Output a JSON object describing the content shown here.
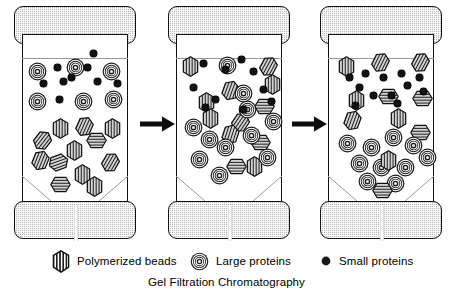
{
  "figure": {
    "caption": "Gel Filtration Chromatography"
  },
  "legend": {
    "items": [
      {
        "icon": "hexagon-hatched-bead-icon",
        "label": "Polymerized beads"
      },
      {
        "icon": "concentric-circle-icon",
        "label": "Large proteins"
      },
      {
        "icon": "solid-dot-icon",
        "label": "Small proteins"
      }
    ]
  },
  "colors": {
    "outline": "#111111",
    "cap_fill": "#b9b9b9",
    "particle_dark": "#1a1a1a",
    "background": "#ffffff"
  },
  "columns": [
    {
      "name": "column-stage-1",
      "stage": "loading",
      "counts": {
        "beads": 12,
        "large_proteins": 6,
        "small_proteins": 9
      },
      "particles": [
        {
          "type": "large",
          "x": 6,
          "y": 28,
          "rot": 0
        },
        {
          "type": "large",
          "x": 44,
          "y": 24,
          "rot": 0
        },
        {
          "type": "large",
          "x": 80,
          "y": 28,
          "rot": 0
        },
        {
          "type": "large",
          "x": 6,
          "y": 58,
          "rot": 0
        },
        {
          "type": "large",
          "x": 52,
          "y": 58,
          "rot": 0
        },
        {
          "type": "large",
          "x": 82,
          "y": 56,
          "rot": 0
        },
        {
          "type": "small",
          "x": 32,
          "y": 30,
          "rot": 0
        },
        {
          "type": "small",
          "x": 62,
          "y": 30,
          "rot": 0
        },
        {
          "type": "small",
          "x": 18,
          "y": 46,
          "rot": 0
        },
        {
          "type": "small",
          "x": 38,
          "y": 44,
          "rot": 0
        },
        {
          "type": "small",
          "x": 46,
          "y": 40,
          "rot": 0
        },
        {
          "type": "small",
          "x": 72,
          "y": 44,
          "rot": 0
        },
        {
          "type": "small",
          "x": 92,
          "y": 46,
          "rot": 0
        },
        {
          "type": "small",
          "x": 34,
          "y": 62,
          "rot": 0
        },
        {
          "type": "small",
          "x": 68,
          "y": 16,
          "rot": 0
        },
        {
          "type": "bead",
          "x": 30,
          "y": 84,
          "rot": 0
        },
        {
          "type": "bead",
          "x": 54,
          "y": 82,
          "rot": 24
        },
        {
          "type": "bead",
          "x": 82,
          "y": 84,
          "rot": 0
        },
        {
          "type": "bead",
          "x": 12,
          "y": 96,
          "rot": 38
        },
        {
          "type": "bead",
          "x": 66,
          "y": 96,
          "rot": 90
        },
        {
          "type": "bead",
          "x": 44,
          "y": 106,
          "rot": 0
        },
        {
          "type": "bead",
          "x": 10,
          "y": 116,
          "rot": 22
        },
        {
          "type": "bead",
          "x": 28,
          "y": 118,
          "rot": 70
        },
        {
          "type": "bead",
          "x": 80,
          "y": 118,
          "rot": 30
        },
        {
          "type": "bead",
          "x": 52,
          "y": 130,
          "rot": 0
        },
        {
          "type": "bead",
          "x": 30,
          "y": 140,
          "rot": 90
        },
        {
          "type": "bead",
          "x": 64,
          "y": 142,
          "rot": 0
        }
      ]
    },
    {
      "name": "column-stage-2",
      "stage": "separating",
      "counts": {
        "beads": 12,
        "large_proteins": 11,
        "small_proteins": 10
      },
      "particles": [
        {
          "type": "bead",
          "x": 6,
          "y": 22,
          "rot": 0
        },
        {
          "type": "bead",
          "x": 84,
          "y": 22,
          "rot": 28
        },
        {
          "type": "bead",
          "x": 46,
          "y": 46,
          "rot": 20
        },
        {
          "type": "bead",
          "x": 22,
          "y": 58,
          "rot": 0
        },
        {
          "type": "bead",
          "x": 80,
          "y": 62,
          "rot": 90
        },
        {
          "type": "bead",
          "x": 88,
          "y": 40,
          "rot": 0
        },
        {
          "type": "bead",
          "x": 26,
          "y": 74,
          "rot": 0
        },
        {
          "type": "bead",
          "x": 56,
          "y": 78,
          "rot": 34
        },
        {
          "type": "bead",
          "x": 46,
          "y": 90,
          "rot": 18
        },
        {
          "type": "bead",
          "x": 76,
          "y": 98,
          "rot": 90
        },
        {
          "type": "bead",
          "x": 52,
          "y": 122,
          "rot": 90
        },
        {
          "type": "bead",
          "x": 70,
          "y": 122,
          "rot": 0
        },
        {
          "type": "large",
          "x": 42,
          "y": 22,
          "rot": 0
        },
        {
          "type": "large",
          "x": 58,
          "y": 50,
          "rot": 0
        },
        {
          "type": "large",
          "x": 8,
          "y": 84,
          "rot": 0
        },
        {
          "type": "large",
          "x": 40,
          "y": 104,
          "rot": 0
        },
        {
          "type": "large",
          "x": 14,
          "y": 116,
          "rot": 0
        },
        {
          "type": "large",
          "x": 82,
          "y": 114,
          "rot": 0
        },
        {
          "type": "large",
          "x": 34,
          "y": 132,
          "rot": 0
        },
        {
          "type": "large",
          "x": 66,
          "y": 92,
          "rot": 0
        },
        {
          "type": "large",
          "x": 24,
          "y": 96,
          "rot": 0
        },
        {
          "type": "large",
          "x": 62,
          "y": 66,
          "rot": 0
        },
        {
          "type": "large",
          "x": 88,
          "y": 78,
          "rot": 0
        },
        {
          "type": "small",
          "x": 24,
          "y": 26,
          "rot": 0
        },
        {
          "type": "small",
          "x": 62,
          "y": 22,
          "rot": 0
        },
        {
          "type": "small",
          "x": 74,
          "y": 34,
          "rot": 0
        },
        {
          "type": "small",
          "x": 14,
          "y": 50,
          "rot": 0
        },
        {
          "type": "small",
          "x": 84,
          "y": 52,
          "rot": 0
        },
        {
          "type": "small",
          "x": 36,
          "y": 62,
          "rot": 0
        },
        {
          "type": "small",
          "x": 26,
          "y": 70,
          "rot": 0
        },
        {
          "type": "small",
          "x": 64,
          "y": 72,
          "rot": 0
        },
        {
          "type": "small",
          "x": 46,
          "y": 32,
          "rot": 0
        },
        {
          "type": "small",
          "x": 92,
          "y": 64,
          "rot": 0
        }
      ]
    },
    {
      "name": "column-stage-3",
      "stage": "separated",
      "counts": {
        "beads": 8,
        "large_proteins": 12,
        "small_proteins": 12
      },
      "particles": [
        {
          "type": "bead",
          "x": 10,
          "y": 22,
          "rot": 0
        },
        {
          "type": "bead",
          "x": 44,
          "y": 18,
          "rot": 26
        },
        {
          "type": "bead",
          "x": 84,
          "y": 18,
          "rot": 28
        },
        {
          "type": "bead",
          "x": 20,
          "y": 56,
          "rot": 0
        },
        {
          "type": "bead",
          "x": 52,
          "y": 52,
          "rot": 90
        },
        {
          "type": "bead",
          "x": 86,
          "y": 54,
          "rot": 90
        },
        {
          "type": "bead",
          "x": 16,
          "y": 76,
          "rot": 20
        },
        {
          "type": "bead",
          "x": 62,
          "y": 74,
          "rot": 0
        },
        {
          "type": "small",
          "x": 18,
          "y": 40,
          "rot": 0
        },
        {
          "type": "small",
          "x": 34,
          "y": 36,
          "rot": 0
        },
        {
          "type": "small",
          "x": 52,
          "y": 40,
          "rot": 0
        },
        {
          "type": "small",
          "x": 70,
          "y": 36,
          "rot": 0
        },
        {
          "type": "small",
          "x": 88,
          "y": 40,
          "rot": 0
        },
        {
          "type": "small",
          "x": 28,
          "y": 50,
          "rot": 0
        },
        {
          "type": "small",
          "x": 76,
          "y": 48,
          "rot": 0
        },
        {
          "type": "small",
          "x": 42,
          "y": 58,
          "rot": 0
        },
        {
          "type": "small",
          "x": 60,
          "y": 58,
          "rot": 0
        },
        {
          "type": "small",
          "x": 92,
          "y": 54,
          "rot": 0
        },
        {
          "type": "small",
          "x": 24,
          "y": 68,
          "rot": 0
        },
        {
          "type": "small",
          "x": 66,
          "y": 66,
          "rot": 0
        },
        {
          "type": "bead",
          "x": 84,
          "y": 88,
          "rot": 90
        },
        {
          "type": "large",
          "x": 10,
          "y": 100,
          "rot": 0
        },
        {
          "type": "large",
          "x": 34,
          "y": 104,
          "rot": 0
        },
        {
          "type": "large",
          "x": 56,
          "y": 94,
          "rot": 0
        },
        {
          "type": "large",
          "x": 76,
          "y": 102,
          "rot": 0
        },
        {
          "type": "large",
          "x": 90,
          "y": 114,
          "rot": 0
        },
        {
          "type": "large",
          "x": 22,
          "y": 120,
          "rot": 0
        },
        {
          "type": "large",
          "x": 44,
          "y": 124,
          "rot": 0
        },
        {
          "type": "large",
          "x": 68,
          "y": 124,
          "rot": 0
        },
        {
          "type": "large",
          "x": 30,
          "y": 138,
          "rot": 0
        },
        {
          "type": "large",
          "x": 58,
          "y": 140,
          "rot": 0
        },
        {
          "type": "bead",
          "x": 52,
          "y": 116,
          "rot": 0
        },
        {
          "type": "bead",
          "x": 46,
          "y": 146,
          "rot": 90
        }
      ]
    }
  ],
  "arrows": [
    {
      "name": "arrow-stage-1-to-2",
      "direction": "right"
    },
    {
      "name": "arrow-stage-2-to-3",
      "direction": "right"
    }
  ]
}
